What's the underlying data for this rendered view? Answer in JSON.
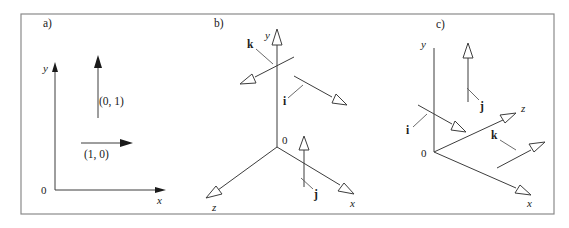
{
  "figure": {
    "background": "#ffffff",
    "line_color": "#3d3d3d",
    "frame_color": "#8a8a8a"
  },
  "panels": [
    {
      "id": "a",
      "label": "a)",
      "kind": "2d-cartesian",
      "origin_label": "0",
      "axes": [
        {
          "name": "y",
          "label": "y",
          "direction": "up",
          "arrowhead": "solid"
        },
        {
          "name": "x",
          "label": "x",
          "direction": "right",
          "arrowhead": "solid"
        }
      ],
      "vectors": [
        {
          "name": "e2",
          "label": "(0, 1)",
          "direction": "up",
          "arrowhead": "solid"
        },
        {
          "name": "e1",
          "label": "(1, 0)",
          "direction": "right",
          "arrowhead": "solid"
        }
      ]
    },
    {
      "id": "b",
      "label": "b)",
      "kind": "3d-cartesian",
      "origin_label": "0",
      "handedness": "left-handed-view",
      "axes": [
        {
          "name": "y",
          "label": "y",
          "direction": "up",
          "arrowhead": "hollow"
        },
        {
          "name": "z",
          "label": "z",
          "direction": "down-left",
          "arrowhead": "hollow"
        },
        {
          "name": "x",
          "label": "x",
          "direction": "down-right",
          "arrowhead": "hollow"
        }
      ],
      "vectors": [
        {
          "name": "k",
          "label": "k",
          "direction": "down-left",
          "arrowhead": "hollow",
          "attached_axis": "z"
        },
        {
          "name": "i",
          "label": "i",
          "direction": "down-right",
          "arrowhead": "hollow",
          "attached_axis": "x"
        },
        {
          "name": "j",
          "label": "j",
          "direction": "up",
          "arrowhead": "hollow",
          "attached_axis": "y"
        }
      ]
    },
    {
      "id": "c",
      "label": "c)",
      "kind": "3d-cartesian",
      "origin_label": "0",
      "handedness": "right-handed-view",
      "axes": [
        {
          "name": "y",
          "label": "y",
          "direction": "up",
          "arrowhead": "none"
        },
        {
          "name": "z",
          "label": "z",
          "direction": "up-right",
          "arrowhead": "hollow"
        },
        {
          "name": "x",
          "label": "x",
          "direction": "down-right",
          "arrowhead": "hollow"
        }
      ],
      "vectors": [
        {
          "name": "j",
          "label": "j",
          "direction": "up",
          "arrowhead": "hollow",
          "attached_axis": "y"
        },
        {
          "name": "i",
          "label": "i",
          "direction": "down-right",
          "arrowhead": "hollow",
          "attached_axis": "x"
        },
        {
          "name": "k",
          "label": "k",
          "direction": "up-right",
          "arrowhead": "hollow",
          "attached_axis": "z"
        }
      ]
    }
  ]
}
